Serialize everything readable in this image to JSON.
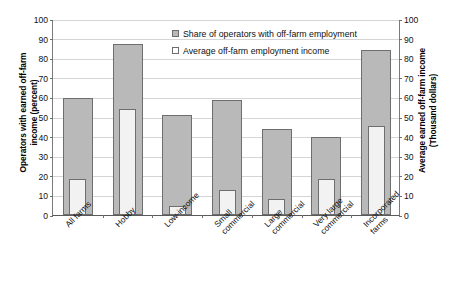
{
  "chart_data": {
    "type": "bar",
    "title": "",
    "subtitle": "",
    "categories": [
      "All farms",
      "Hobby",
      "Low-income",
      "Small\ncommercial",
      "Large\ncommercial",
      "Very large\ncommercial",
      "Incorporated\nfarms"
    ],
    "series": [
      {
        "name": "Share of operators with off-farm employment",
        "axis": "left",
        "units": "percent",
        "fill": "#b9b9b9",
        "values": [
          59.5,
          87,
          51,
          58.5,
          44,
          40,
          84
        ]
      },
      {
        "name": "Average off-farm employment income",
        "axis": "right",
        "units": "thousand dollars",
        "fill": "#f2f2f2",
        "values": [
          18.5,
          54,
          4.5,
          13,
          8,
          18.5,
          45.5
        ]
      }
    ],
    "xlabel": "",
    "ylabel": "Operators with earned off-farm income (percent)",
    "y2label": "Average earned off-farm income (Thousand dollars)",
    "ylim": [
      0,
      100
    ],
    "y2lim": [
      0,
      100
    ],
    "yticks": [
      0,
      10,
      20,
      30,
      40,
      50,
      60,
      70,
      80,
      90,
      100
    ],
    "y2ticks": [
      0,
      10,
      20,
      30,
      40,
      50,
      60,
      70,
      80,
      90,
      100
    ],
    "grid": "horizontal",
    "legend_position": "top-center"
  },
  "axes": {
    "left_title": "Operators with earned off-farm\nincome (percent)",
    "right_title": "Average earned off-farm income\n(Thousand dollars)",
    "tick_labels": [
      "100",
      "90",
      "80",
      "70",
      "60",
      "50",
      "40",
      "30",
      "20",
      "10",
      "0"
    ]
  },
  "legend": {
    "items": [
      {
        "label": "Share of operators with off-farm employment",
        "swatch": "gray-square-icon"
      },
      {
        "label": "Average off-farm employment income",
        "swatch": "white-square-icon"
      }
    ]
  }
}
